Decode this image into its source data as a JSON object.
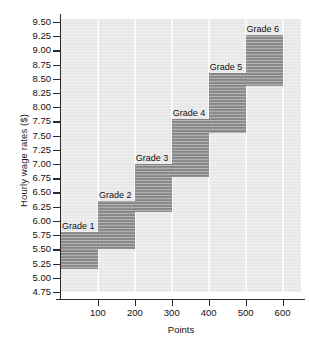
{
  "chart_data": {
    "type": "bar",
    "title": "",
    "subtitle": "",
    "xlabel": "Points",
    "ylabel": "Hourly wage rates ($)",
    "xlim": [
      0,
      650
    ],
    "ylim": [
      4.75,
      9.55
    ],
    "grid": "vertical-white-gridlines-at-x-ticks",
    "legend": "none (bars labeled in-place)",
    "orientation": "stepped wage bands",
    "xticks": [
      100,
      200,
      300,
      400,
      500,
      600
    ],
    "xticklabels": [
      "100",
      "200",
      "300",
      "400",
      "500",
      "600"
    ],
    "yticks": [
      4.75,
      5.0,
      5.25,
      5.5,
      5.75,
      6.0,
      6.25,
      6.5,
      6.75,
      7.0,
      7.25,
      7.5,
      7.75,
      8.0,
      8.25,
      8.5,
      8.75,
      9.0,
      9.25,
      9.5
    ],
    "yticklabels": [
      "4.75",
      "5.00",
      "5.25",
      "5.50",
      "5.75",
      "6.00",
      "6.25",
      "6.50",
      "6.75",
      "7.00",
      "7.25",
      "7.50",
      "7.75",
      "8.00",
      "8.25",
      "8.50",
      "8.75",
      "9.00",
      "9.25",
      "9.50"
    ],
    "bar_color": "#888888",
    "plot_background": "#e9e9e9",
    "gridline_color": "#fbfbfb",
    "axis_color": "#2b2b2b",
    "series": [
      {
        "name": "Grade 1",
        "label": "Grade 1",
        "x_start": 0,
        "x_end": 100,
        "y_min": 5.15,
        "y_max": 5.8,
        "label_position": "above-left-inside"
      },
      {
        "name": "Grade 2",
        "label": "Grade 2",
        "x_start": 100,
        "x_end": 200,
        "y_min": 5.5,
        "y_max": 6.35,
        "label_position": "above"
      },
      {
        "name": "Grade 3",
        "label": "Grade 3",
        "x_start": 200,
        "x_end": 300,
        "y_min": 6.15,
        "y_max": 7.0,
        "label_position": "above"
      },
      {
        "name": "Grade 4",
        "label": "Grade 4",
        "x_start": 300,
        "x_end": 400,
        "y_min": 6.78,
        "y_max": 7.8,
        "label_position": "above"
      },
      {
        "name": "Grade 5",
        "label": "Grade 5",
        "x_start": 400,
        "x_end": 500,
        "y_min": 7.55,
        "y_max": 8.6,
        "label_position": "above"
      },
      {
        "name": "Grade 6",
        "label": "Grade 6",
        "x_start": 500,
        "x_end": 600,
        "y_min": 8.38,
        "y_max": 9.27,
        "label_position": "above"
      }
    ]
  }
}
